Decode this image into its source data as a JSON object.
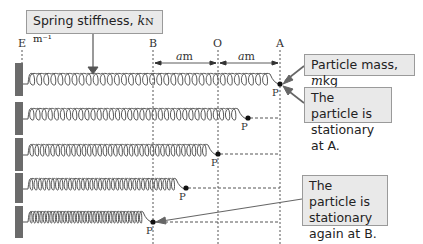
{
  "diagram": {
    "title_callouts": {
      "spring_stiffness": {
        "text": "Spring stiffness, ",
        "var": "k",
        "unit": "N m⁻¹"
      },
      "particle_mass": {
        "text": "Particle mass, ",
        "var": "m",
        "unit": "kg"
      },
      "stationary_a": {
        "line1": "The particle is",
        "line2": "stationary at A."
      },
      "stationary_b": {
        "line1": "The particle is",
        "line2": "stationary",
        "line3": "again at B."
      }
    },
    "position_labels": {
      "e": "E",
      "b": "B",
      "o": "O",
      "a": "A"
    },
    "distance_labels": [
      {
        "var": "a",
        "unit": "m",
        "between": "B-O"
      },
      {
        "var": "a",
        "unit": "m",
        "between": "O-A"
      }
    ],
    "particle_label": "P",
    "rows": [
      {
        "index": 1,
        "particle_x": 280,
        "note": "at A"
      },
      {
        "index": 2,
        "particle_x": 248,
        "note": "between O and A"
      },
      {
        "index": 3,
        "particle_x": 218,
        "note": "at O"
      },
      {
        "index": 4,
        "particle_x": 186,
        "note": "between B and O"
      },
      {
        "index": 5,
        "particle_x": 153,
        "note": "at B"
      }
    ],
    "colors": {
      "spring": "#555555",
      "wall": "#6b6b6b",
      "callout_bg": "#e9e9e9",
      "callout_border": "#9a9a9a",
      "guide": "#555555"
    }
  }
}
